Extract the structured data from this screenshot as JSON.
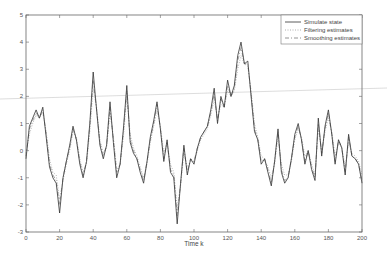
{
  "chart_data": {
    "type": "line",
    "title": "",
    "xlabel": "Time k",
    "ylabel": "",
    "xlim": [
      0,
      200
    ],
    "ylim": [
      -3,
      5
    ],
    "xticks": [
      0,
      20,
      40,
      60,
      80,
      100,
      120,
      140,
      160,
      180,
      200
    ],
    "yticks": [
      -3,
      -2,
      -1,
      0,
      1,
      2,
      3,
      4,
      5
    ],
    "grid": false,
    "legend_position": "upper right",
    "legend": [
      "Simulate state",
      "Filtering estimates",
      "Smoothing estimates"
    ],
    "x": [
      0,
      2,
      4,
      6,
      8,
      10,
      12,
      14,
      16,
      18,
      20,
      22,
      24,
      26,
      28,
      30,
      32,
      34,
      36,
      38,
      40,
      42,
      44,
      46,
      48,
      50,
      52,
      54,
      56,
      58,
      60,
      62,
      64,
      66,
      68,
      70,
      72,
      74,
      76,
      78,
      80,
      82,
      84,
      86,
      88,
      90,
      92,
      94,
      96,
      98,
      100,
      102,
      104,
      106,
      108,
      110,
      112,
      114,
      116,
      118,
      120,
      122,
      124,
      126,
      128,
      130,
      132,
      134,
      136,
      138,
      140,
      142,
      144,
      146,
      148,
      150,
      152,
      154,
      156,
      158,
      160,
      162,
      164,
      166,
      168,
      170,
      172,
      174,
      176,
      178,
      180,
      182,
      184,
      186,
      188,
      190,
      192,
      194,
      196,
      198,
      200
    ],
    "series": [
      {
        "name": "Simulate state",
        "style": "solid",
        "color": "#333333",
        "values": [
          -0.3,
          0.9,
          1.2,
          1.5,
          1.2,
          1.6,
          0.5,
          -0.6,
          -1.0,
          -1.2,
          -2.3,
          -1.0,
          -0.4,
          0.2,
          0.9,
          0.4,
          -0.5,
          -1.0,
          -0.4,
          1.0,
          2.9,
          1.5,
          0.2,
          -0.3,
          0.2,
          1.8,
          0.3,
          -1.0,
          -0.5,
          0.8,
          2.4,
          0.3,
          -0.1,
          -0.3,
          -0.8,
          -1.2,
          -0.4,
          0.5,
          1.1,
          1.8,
          0.8,
          -0.4,
          0.4,
          -0.8,
          -1.0,
          -2.7,
          -1.2,
          0.2,
          -0.9,
          -0.3,
          -0.5,
          0.1,
          0.5,
          0.7,
          0.9,
          1.5,
          2.3,
          1.0,
          2.0,
          1.6,
          2.6,
          2.0,
          2.4,
          3.5,
          4.0,
          3.2,
          3.3,
          2.0,
          0.7,
          0.4,
          -0.5,
          -0.3,
          -0.8,
          -1.3,
          -0.4,
          0.8,
          -0.8,
          -1.2,
          -1.0,
          -0.3,
          0.6,
          1.0,
          0.4,
          -0.5,
          0.0,
          -0.7,
          -1.1,
          1.2,
          -0.2,
          0.9,
          1.5,
          0.6,
          -0.5,
          0.4,
          0.1,
          -0.9,
          0.6,
          -0.2,
          -0.3,
          -0.5,
          -1.2
        ]
      },
      {
        "name": "Filtering estimates",
        "style": "dotted",
        "color": "#9a9a9a",
        "values": [
          -0.1,
          0.6,
          1.0,
          1.3,
          1.2,
          1.4,
          0.7,
          -0.3,
          -0.8,
          -0.9,
          -1.8,
          -1.1,
          -0.5,
          0.0,
          0.7,
          0.5,
          -0.3,
          -0.8,
          -0.5,
          0.7,
          2.3,
          1.6,
          0.4,
          -0.1,
          0.1,
          1.4,
          0.5,
          -0.7,
          -0.5,
          0.5,
          2.0,
          0.6,
          0.1,
          -0.2,
          -0.6,
          -1.0,
          -0.5,
          0.3,
          0.9,
          1.5,
          0.9,
          -0.1,
          0.3,
          -0.5,
          -0.8,
          -2.1,
          -1.3,
          -0.1,
          -0.6,
          -0.4,
          -0.4,
          0.0,
          0.4,
          0.6,
          0.8,
          1.3,
          1.9,
          1.2,
          1.7,
          1.6,
          2.2,
          2.0,
          2.2,
          3.0,
          3.5,
          3.2,
          3.1,
          2.2,
          1.0,
          0.5,
          -0.2,
          -0.3,
          -0.6,
          -1.0,
          -0.5,
          0.5,
          -0.5,
          -0.9,
          -0.9,
          -0.4,
          0.4,
          0.8,
          0.5,
          -0.2,
          0.0,
          -0.5,
          -0.9,
          0.8,
          0.0,
          0.7,
          1.2,
          0.7,
          -0.2,
          0.3,
          0.1,
          -0.6,
          0.3,
          -0.1,
          -0.2,
          -0.4,
          -0.9
        ]
      },
      {
        "name": "Smoothing estimates",
        "style": "dashdot",
        "color": "#7a7a7a",
        "values": [
          -0.2,
          0.8,
          1.1,
          1.4,
          1.2,
          1.5,
          0.6,
          -0.5,
          -0.9,
          -1.1,
          -2.0,
          -1.0,
          -0.4,
          0.1,
          0.8,
          0.4,
          -0.4,
          -0.9,
          -0.4,
          0.9,
          2.6,
          1.5,
          0.3,
          -0.2,
          0.2,
          1.6,
          0.4,
          -0.8,
          -0.5,
          0.7,
          2.2,
          0.4,
          0.0,
          -0.3,
          -0.7,
          -1.1,
          -0.4,
          0.4,
          1.0,
          1.7,
          0.8,
          -0.3,
          0.3,
          -0.7,
          -0.9,
          -2.4,
          -1.2,
          0.1,
          -0.8,
          -0.3,
          -0.4,
          0.1,
          0.5,
          0.7,
          0.9,
          1.4,
          2.1,
          1.1,
          1.9,
          1.6,
          2.4,
          2.0,
          2.3,
          3.3,
          3.8,
          3.2,
          3.2,
          2.1,
          0.8,
          0.4,
          -0.4,
          -0.3,
          -0.7,
          -1.2,
          -0.4,
          0.7,
          -0.7,
          -1.1,
          -1.0,
          -0.3,
          0.5,
          0.9,
          0.4,
          -0.4,
          0.0,
          -0.6,
          -1.0,
          1.0,
          -0.1,
          0.8,
          1.4,
          0.6,
          -0.4,
          0.4,
          0.1,
          -0.8,
          0.5,
          -0.2,
          -0.3,
          -0.5,
          -1.1
        ]
      }
    ]
  },
  "colors": {
    "axis": "#666666",
    "background": "#ffffff",
    "scan_artifact_line": "#d0d0d0"
  }
}
